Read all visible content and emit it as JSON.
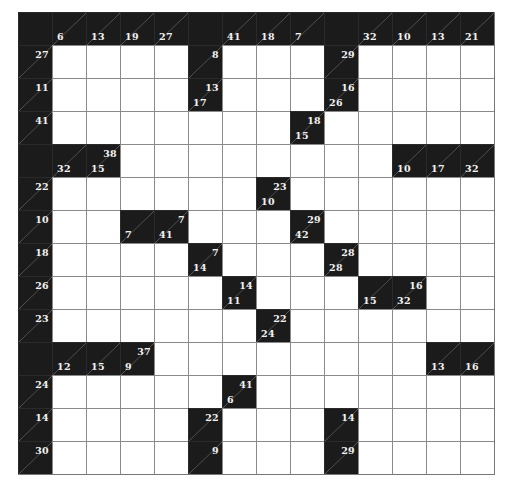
{
  "puzzle": {
    "type": "kakuro",
    "rows": 14,
    "cols": 14,
    "colors": {
      "black": "#1b1b1b",
      "white": "#ffffff",
      "clue_text": "#f2f2f2",
      "grid_line": "#8a8a8a"
    },
    "cells": [
      [
        [
          "B"
        ],
        [
          "C",
          null,
          6
        ],
        [
          "C",
          null,
          13
        ],
        [
          "C",
          null,
          19
        ],
        [
          "C",
          null,
          27
        ],
        [
          "B"
        ],
        [
          "C",
          null,
          41
        ],
        [
          "C",
          null,
          18
        ],
        [
          "C",
          null,
          7
        ],
        [
          "B"
        ],
        [
          "C",
          null,
          32
        ],
        [
          "C",
          null,
          10
        ],
        [
          "C",
          null,
          13
        ],
        [
          "C",
          null,
          21
        ]
      ],
      [
        [
          "C",
          27,
          null
        ],
        [
          "W"
        ],
        [
          "W"
        ],
        [
          "W"
        ],
        [
          "W"
        ],
        [
          "C",
          8,
          null
        ],
        [
          "W"
        ],
        [
          "W"
        ],
        [
          "W"
        ],
        [
          "C",
          29,
          null
        ],
        [
          "W"
        ],
        [
          "W"
        ],
        [
          "W"
        ],
        [
          "W"
        ]
      ],
      [
        [
          "C",
          11,
          null
        ],
        [
          "W"
        ],
        [
          "W"
        ],
        [
          "W"
        ],
        [
          "W"
        ],
        [
          "C",
          13,
          17
        ],
        [
          "W"
        ],
        [
          "W"
        ],
        [
          "W"
        ],
        [
          "C",
          16,
          26
        ],
        [
          "W"
        ],
        [
          "W"
        ],
        [
          "W"
        ],
        [
          "W"
        ]
      ],
      [
        [
          "C",
          41,
          null
        ],
        [
          "W"
        ],
        [
          "W"
        ],
        [
          "W"
        ],
        [
          "W"
        ],
        [
          "W"
        ],
        [
          "W"
        ],
        [
          "W"
        ],
        [
          "C",
          18,
          15
        ],
        [
          "W"
        ],
        [
          "W"
        ],
        [
          "W"
        ],
        [
          "W"
        ],
        [
          "W"
        ]
      ],
      [
        [
          "B"
        ],
        [
          "C",
          null,
          32
        ],
        [
          "C",
          38,
          15
        ],
        [
          "W"
        ],
        [
          "W"
        ],
        [
          "W"
        ],
        [
          "W"
        ],
        [
          "W"
        ],
        [
          "W"
        ],
        [
          "W"
        ],
        [
          "W"
        ],
        [
          "C",
          null,
          10
        ],
        [
          "C",
          null,
          17
        ],
        [
          "C",
          null,
          32
        ]
      ],
      [
        [
          "C",
          22,
          null
        ],
        [
          "W"
        ],
        [
          "W"
        ],
        [
          "W"
        ],
        [
          "W"
        ],
        [
          "W"
        ],
        [
          "W"
        ],
        [
          "C",
          23,
          10
        ],
        [
          "W"
        ],
        [
          "W"
        ],
        [
          "W"
        ],
        [
          "W"
        ],
        [
          "W"
        ],
        [
          "W"
        ]
      ],
      [
        [
          "C",
          10,
          null
        ],
        [
          "W"
        ],
        [
          "W"
        ],
        [
          "C",
          null,
          7
        ],
        [
          "C",
          7,
          41
        ],
        [
          "W"
        ],
        [
          "W"
        ],
        [
          "W"
        ],
        [
          "C",
          29,
          42
        ],
        [
          "W"
        ],
        [
          "W"
        ],
        [
          "W"
        ],
        [
          "W"
        ],
        [
          "W"
        ]
      ],
      [
        [
          "C",
          18,
          null
        ],
        [
          "W"
        ],
        [
          "W"
        ],
        [
          "W"
        ],
        [
          "W"
        ],
        [
          "C",
          7,
          14
        ],
        [
          "W"
        ],
        [
          "W"
        ],
        [
          "W"
        ],
        [
          "C",
          28,
          28
        ],
        [
          "W"
        ],
        [
          "W"
        ],
        [
          "W"
        ],
        [
          "W"
        ]
      ],
      [
        [
          "C",
          26,
          null
        ],
        [
          "W"
        ],
        [
          "W"
        ],
        [
          "W"
        ],
        [
          "W"
        ],
        [
          "W"
        ],
        [
          "C",
          14,
          11
        ],
        [
          "W"
        ],
        [
          "W"
        ],
        [
          "W"
        ],
        [
          "C",
          null,
          15
        ],
        [
          "C",
          16,
          32
        ],
        [
          "W"
        ],
        [
          "W"
        ]
      ],
      [
        [
          "C",
          23,
          null
        ],
        [
          "W"
        ],
        [
          "W"
        ],
        [
          "W"
        ],
        [
          "W"
        ],
        [
          "W"
        ],
        [
          "W"
        ],
        [
          "C",
          22,
          24
        ],
        [
          "W"
        ],
        [
          "W"
        ],
        [
          "W"
        ],
        [
          "W"
        ],
        [
          "W"
        ],
        [
          "W"
        ]
      ],
      [
        [
          "B"
        ],
        [
          "C",
          null,
          12
        ],
        [
          "C",
          null,
          15
        ],
        [
          "C",
          37,
          9
        ],
        [
          "W"
        ],
        [
          "W"
        ],
        [
          "W"
        ],
        [
          "W"
        ],
        [
          "W"
        ],
        [
          "W"
        ],
        [
          "W"
        ],
        [
          "W"
        ],
        [
          "C",
          null,
          13
        ],
        [
          "C",
          null,
          16
        ]
      ],
      [
        [
          "C",
          24,
          null
        ],
        [
          "W"
        ],
        [
          "W"
        ],
        [
          "W"
        ],
        [
          "W"
        ],
        [
          "W"
        ],
        [
          "C",
          41,
          6
        ],
        [
          "W"
        ],
        [
          "W"
        ],
        [
          "W"
        ],
        [
          "W"
        ],
        [
          "W"
        ],
        [
          "W"
        ],
        [
          "W"
        ]
      ],
      [
        [
          "C",
          14,
          null
        ],
        [
          "W"
        ],
        [
          "W"
        ],
        [
          "W"
        ],
        [
          "W"
        ],
        [
          "C",
          22,
          null
        ],
        [
          "W"
        ],
        [
          "W"
        ],
        [
          "W"
        ],
        [
          "C",
          14,
          null
        ],
        [
          "W"
        ],
        [
          "W"
        ],
        [
          "W"
        ],
        [
          "W"
        ]
      ],
      [
        [
          "C",
          30,
          null
        ],
        [
          "W"
        ],
        [
          "W"
        ],
        [
          "W"
        ],
        [
          "W"
        ],
        [
          "C",
          9,
          null
        ],
        [
          "W"
        ],
        [
          "W"
        ],
        [
          "W"
        ],
        [
          "C",
          29,
          null
        ],
        [
          "W"
        ],
        [
          "W"
        ],
        [
          "W"
        ],
        [
          "W"
        ]
      ]
    ]
  },
  "legend": {
    "B": "plain black cell",
    "C": "clue cell [type, across_sum(right), down_sum(below)]",
    "W": "empty white entry cell"
  }
}
